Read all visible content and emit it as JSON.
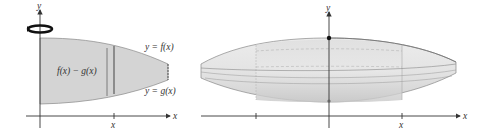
{
  "left_figure": {
    "axis_y_label": "y",
    "axis_x_label": "x",
    "tick_x_label": "x",
    "upper_curve_label": "y = f(x)",
    "lower_curve_label": "y = g(x)",
    "height_label": "f(x) − g(x)",
    "rotation_icon": "rotation-arrow-icon",
    "region_fill": "#d4d4d4"
  },
  "right_figure": {
    "axis_y_label": "y",
    "axis_x_label": "x",
    "tick_x_label": "x",
    "solid_fill": "#e2e2e2",
    "shell_fill": "#d0d0d0"
  }
}
